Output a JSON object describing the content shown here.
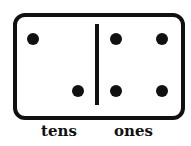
{
  "domino": {
    "left_half": {
      "name": "tens",
      "dots": 2
    },
    "right_half": {
      "name": "ones",
      "dots": 4
    }
  },
  "labels": {
    "tens": "tens",
    "ones": "ones"
  },
  "colors": {
    "ink": "#111111",
    "background": "#ffffff"
  }
}
